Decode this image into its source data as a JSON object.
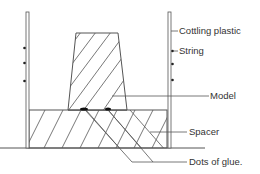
{
  "diagram": {
    "labels": {
      "cottling_plastic": "Cottling plastic",
      "string": "String",
      "model": "Model",
      "spacer": "Spacer",
      "dots_of_glue": "Dots of glue."
    },
    "colors": {
      "line": "#555555",
      "text": "#333333",
      "glue": "#111111",
      "background": "#ffffff"
    }
  }
}
